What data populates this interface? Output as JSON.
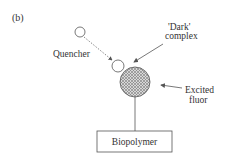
{
  "panel_label": "(b)",
  "labels": {
    "quencher": "Quencher",
    "dark_complex_line1": "'Dark'",
    "dark_complex_line2": "complex",
    "excited_fluor_line1": "Excited",
    "excited_fluor_line2": "fluor",
    "biopolymer": "Biopolymer"
  },
  "colors": {
    "stroke": "#555555",
    "text": "#333333",
    "hatch": "#888888"
  }
}
